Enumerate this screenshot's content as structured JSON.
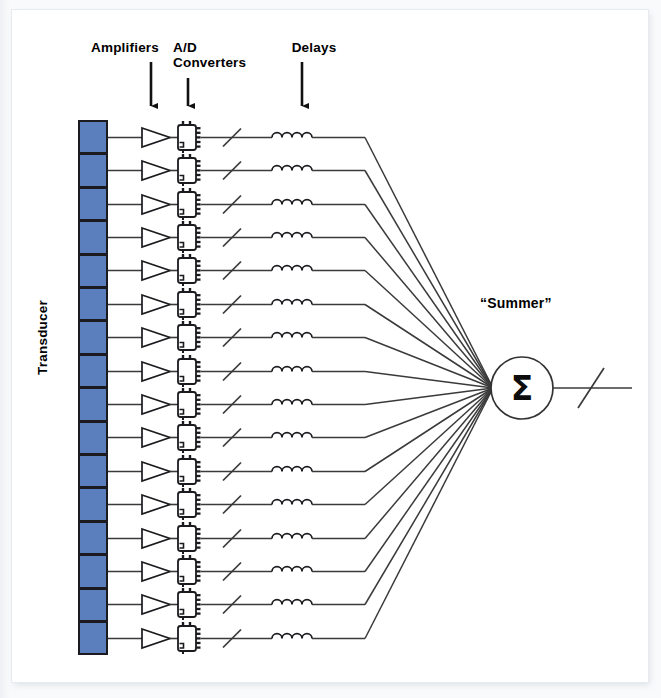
{
  "diagram": {
    "title_labels": {
      "amplifiers": "Amplifiers",
      "adc": "A/D\nConverters",
      "delays": "Delays",
      "transducer": "Transducer",
      "summer": "“Summer”"
    },
    "summer_symbol": "Σ",
    "channel_count": 16,
    "colors": {
      "transducer_fill": "#5b7ebd",
      "outline": "#1b1b1f",
      "wire": "#3a3a3a",
      "page_background": "#f2f4f6",
      "card_background": "#ffffff"
    },
    "components": [
      {
        "name": "transducer-element",
        "symbol": "rectangle",
        "count": 16
      },
      {
        "name": "amplifier",
        "symbol": "triangle",
        "count": 16
      },
      {
        "name": "ad-converter",
        "symbol": "ic-block",
        "count": 16
      },
      {
        "name": "bus-slash",
        "symbol": "diagonal-slash",
        "count": 16
      },
      {
        "name": "delay",
        "symbol": "inductor-coil",
        "count": 16
      },
      {
        "name": "summer",
        "symbol": "circle-sigma",
        "count": 1
      },
      {
        "name": "output-bus-slash",
        "symbol": "diagonal-slash",
        "count": 1
      }
    ],
    "geometry": {
      "array_x": 78,
      "array_width": 30,
      "array_top": 120,
      "cell_height": 33.4,
      "amp_x": 142,
      "amp_width": 28,
      "adc_x": 178,
      "adc_width": 18,
      "slash_x": 232,
      "coil_x": 272,
      "coil_width": 40,
      "bend_x": 365,
      "summer_cx": 522,
      "summer_cy": 388,
      "summer_r": 31,
      "output_end_x": 632
    }
  }
}
